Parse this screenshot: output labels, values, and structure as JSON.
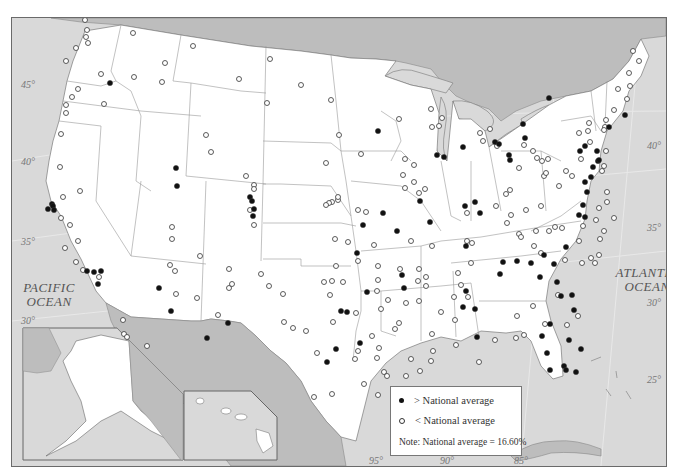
{
  "map": {
    "title": "",
    "ocean_labels": {
      "pacific": [
        "PACIFIC",
        "OCEAN"
      ],
      "atlantic": [
        "ATLANTIC",
        "OCEAN"
      ]
    },
    "latitude_labels_west": [
      "45°",
      "40°",
      "35°",
      "30°"
    ],
    "latitude_labels_east": [
      "40°",
      "35°",
      "30°",
      "25°"
    ],
    "longitude_labels": [
      "95°",
      "90°",
      "85°"
    ],
    "insets": [
      "Alaska",
      "Hawaii"
    ],
    "colors": {
      "land_us": "#ffffff",
      "land_foreign": "#bdbdbd",
      "water": "#d9d9d9",
      "marker_above": "#111111",
      "marker_below": "#ffffff",
      "border": "#6a6a6a"
    }
  },
  "legend": {
    "above_label": "> National average",
    "below_label": "< National average",
    "note": "Note: National average = 16.60%"
  },
  "markers": {
    "above": [
      [
        109,
        82
      ],
      [
        51,
        203
      ],
      [
        47,
        208
      ],
      [
        52,
        205
      ],
      [
        53,
        209
      ],
      [
        86,
        270
      ],
      [
        93,
        271
      ],
      [
        100,
        270
      ],
      [
        97,
        283
      ],
      [
        175,
        167
      ],
      [
        176,
        185
      ],
      [
        249,
        196
      ],
      [
        251,
        200
      ],
      [
        252,
        215
      ],
      [
        253,
        208
      ],
      [
        206,
        337
      ],
      [
        158,
        287
      ],
      [
        170,
        310
      ],
      [
        227,
        322
      ],
      [
        340,
        310
      ],
      [
        346,
        311
      ],
      [
        335,
        348
      ],
      [
        326,
        361
      ],
      [
        359,
        342
      ],
      [
        366,
        291
      ],
      [
        377,
        130
      ],
      [
        403,
        287
      ],
      [
        436,
        154
      ],
      [
        443,
        156
      ],
      [
        462,
        146
      ],
      [
        464,
        205
      ],
      [
        474,
        201
      ],
      [
        462,
        306
      ],
      [
        465,
        290
      ],
      [
        494,
        141
      ],
      [
        498,
        143
      ],
      [
        524,
        137
      ],
      [
        548,
        97
      ],
      [
        508,
        154
      ],
      [
        509,
        159
      ],
      [
        522,
        123
      ],
      [
        465,
        245
      ],
      [
        474,
        308
      ],
      [
        479,
        212
      ],
      [
        516,
        260
      ],
      [
        530,
        262
      ],
      [
        499,
        273
      ],
      [
        502,
        261
      ],
      [
        539,
        276
      ],
      [
        543,
        254
      ],
      [
        553,
        263
      ],
      [
        556,
        281
      ],
      [
        565,
        246
      ],
      [
        584,
        216
      ],
      [
        578,
        214
      ],
      [
        582,
        204
      ],
      [
        586,
        191
      ],
      [
        584,
        181
      ],
      [
        590,
        176
      ],
      [
        592,
        166
      ],
      [
        597,
        160
      ],
      [
        598,
        159
      ],
      [
        596,
        150
      ],
      [
        579,
        150
      ],
      [
        584,
        145
      ],
      [
        608,
        126
      ],
      [
        624,
        114
      ],
      [
        541,
        335
      ],
      [
        546,
        352
      ],
      [
        549,
        369
      ],
      [
        563,
        365
      ],
      [
        565,
        369
      ],
      [
        575,
        371
      ],
      [
        580,
        348
      ],
      [
        568,
        339
      ],
      [
        573,
        309
      ],
      [
        571,
        294
      ],
      [
        560,
        295
      ],
      [
        549,
        323
      ],
      [
        476,
        336
      ],
      [
        356,
        252
      ],
      [
        382,
        212
      ],
      [
        362,
        224
      ],
      [
        401,
        274
      ],
      [
        429,
        221
      ],
      [
        396,
        230
      ],
      [
        419,
        200
      ]
    ],
    "below": [
      [
        84,
        19
      ],
      [
        86,
        29
      ],
      [
        85,
        36
      ],
      [
        87,
        42
      ],
      [
        75,
        47
      ],
      [
        65,
        60
      ],
      [
        100,
        73
      ],
      [
        77,
        88
      ],
      [
        71,
        96
      ],
      [
        65,
        104
      ],
      [
        65,
        112
      ],
      [
        60,
        133
      ],
      [
        59,
        166
      ],
      [
        79,
        190
      ],
      [
        62,
        196
      ],
      [
        60,
        217
      ],
      [
        69,
        224
      ],
      [
        77,
        240
      ],
      [
        64,
        247
      ],
      [
        75,
        261
      ],
      [
        82,
        269
      ],
      [
        98,
        276
      ],
      [
        132,
        32
      ],
      [
        161,
        81
      ],
      [
        133,
        76
      ],
      [
        103,
        103
      ],
      [
        192,
        45
      ],
      [
        164,
        62
      ],
      [
        238,
        78
      ],
      [
        300,
        84
      ],
      [
        330,
        99
      ],
      [
        338,
        134
      ],
      [
        360,
        153
      ],
      [
        325,
        162
      ],
      [
        331,
        201
      ],
      [
        347,
        241
      ],
      [
        365,
        211
      ],
      [
        357,
        209
      ],
      [
        328,
        202
      ],
      [
        337,
        199
      ],
      [
        325,
        204
      ],
      [
        337,
        196
      ],
      [
        269,
        58
      ],
      [
        266,
        102
      ],
      [
        205,
        134
      ],
      [
        210,
        151
      ],
      [
        245,
        175
      ],
      [
        253,
        184
      ],
      [
        253,
        188
      ],
      [
        249,
        209
      ],
      [
        253,
        224
      ],
      [
        228,
        268
      ],
      [
        169,
        264
      ],
      [
        196,
        297
      ],
      [
        175,
        293
      ],
      [
        260,
        273
      ],
      [
        268,
        285
      ],
      [
        282,
        293
      ],
      [
        283,
        321
      ],
      [
        323,
        281
      ],
      [
        335,
        265
      ],
      [
        357,
        260
      ],
      [
        334,
        238
      ],
      [
        373,
        244
      ],
      [
        377,
        265
      ],
      [
        377,
        279
      ],
      [
        376,
        290
      ],
      [
        380,
        308
      ],
      [
        371,
        335
      ],
      [
        378,
        347
      ],
      [
        394,
        328
      ],
      [
        398,
        322
      ],
      [
        405,
        302
      ],
      [
        387,
        299
      ],
      [
        417,
        280
      ],
      [
        418,
        268
      ],
      [
        410,
        240
      ],
      [
        425,
        276
      ],
      [
        431,
        245
      ],
      [
        457,
        272
      ],
      [
        460,
        284
      ],
      [
        467,
        296
      ],
      [
        466,
        240
      ],
      [
        471,
        242
      ],
      [
        470,
        262
      ],
      [
        466,
        212
      ],
      [
        418,
        192
      ],
      [
        413,
        181
      ],
      [
        424,
        188
      ],
      [
        404,
        187
      ],
      [
        402,
        174
      ],
      [
        413,
        164
      ],
      [
        404,
        158
      ],
      [
        430,
        108
      ],
      [
        398,
        118
      ],
      [
        431,
        126
      ],
      [
        438,
        125
      ],
      [
        441,
        117
      ],
      [
        479,
        132
      ],
      [
        489,
        128
      ],
      [
        482,
        140
      ],
      [
        496,
        145
      ],
      [
        505,
        193
      ],
      [
        495,
        205
      ],
      [
        510,
        214
      ],
      [
        506,
        222
      ],
      [
        518,
        233
      ],
      [
        525,
        209
      ],
      [
        518,
        167
      ],
      [
        509,
        189
      ],
      [
        520,
        236
      ],
      [
        535,
        230
      ],
      [
        540,
        205
      ],
      [
        543,
        175
      ],
      [
        541,
        160
      ],
      [
        536,
        157
      ],
      [
        532,
        150
      ],
      [
        523,
        144
      ],
      [
        547,
        158
      ],
      [
        545,
        172
      ],
      [
        558,
        185
      ],
      [
        565,
        170
      ],
      [
        571,
        175
      ],
      [
        580,
        158
      ],
      [
        587,
        130
      ],
      [
        588,
        122
      ],
      [
        589,
        141
      ],
      [
        604,
        126
      ],
      [
        605,
        119
      ],
      [
        613,
        109
      ],
      [
        617,
        88
      ],
      [
        628,
        72
      ],
      [
        632,
        50
      ],
      [
        638,
        60
      ],
      [
        629,
        85
      ],
      [
        626,
        98
      ],
      [
        605,
        150
      ],
      [
        603,
        129
      ],
      [
        554,
        226
      ],
      [
        533,
        245
      ],
      [
        540,
        252
      ],
      [
        548,
        230
      ],
      [
        561,
        227
      ],
      [
        564,
        259
      ],
      [
        557,
        294
      ],
      [
        566,
        324
      ],
      [
        577,
        315
      ],
      [
        581,
        262
      ],
      [
        590,
        257
      ],
      [
        598,
        254
      ],
      [
        599,
        238
      ],
      [
        603,
        230
      ],
      [
        613,
        217
      ],
      [
        594,
        262
      ],
      [
        606,
        201
      ],
      [
        606,
        191
      ],
      [
        598,
        207
      ],
      [
        595,
        219
      ],
      [
        582,
        225
      ],
      [
        578,
        240
      ],
      [
        603,
        165
      ],
      [
        578,
        132
      ],
      [
        601,
        170
      ],
      [
        544,
        323
      ],
      [
        523,
        334
      ],
      [
        516,
        315
      ],
      [
        515,
        337
      ],
      [
        532,
        305
      ],
      [
        494,
        339
      ],
      [
        453,
        296
      ],
      [
        440,
        311
      ],
      [
        425,
        285
      ],
      [
        418,
        300
      ],
      [
        431,
        333
      ],
      [
        430,
        360
      ],
      [
        419,
        370
      ],
      [
        410,
        358
      ],
      [
        432,
        350
      ],
      [
        455,
        344
      ],
      [
        454,
        319
      ],
      [
        478,
        361
      ],
      [
        383,
        371
      ],
      [
        386,
        375
      ],
      [
        405,
        375
      ],
      [
        376,
        357
      ],
      [
        399,
        268
      ],
      [
        377,
        394
      ],
      [
        329,
        294
      ],
      [
        331,
        280
      ],
      [
        342,
        281
      ],
      [
        316,
        352
      ],
      [
        313,
        396
      ],
      [
        331,
        393
      ],
      [
        363,
        383
      ],
      [
        357,
        350
      ],
      [
        354,
        358
      ],
      [
        355,
        312
      ],
      [
        332,
        321
      ],
      [
        292,
        327
      ],
      [
        305,
        330
      ],
      [
        217,
        314
      ],
      [
        228,
        287
      ],
      [
        231,
        283
      ],
      [
        199,
        255
      ],
      [
        171,
        226
      ],
      [
        171,
        238
      ],
      [
        174,
        270
      ],
      [
        146,
        345
      ],
      [
        122,
        319
      ],
      [
        123,
        333
      ],
      [
        126,
        336
      ]
    ]
  }
}
